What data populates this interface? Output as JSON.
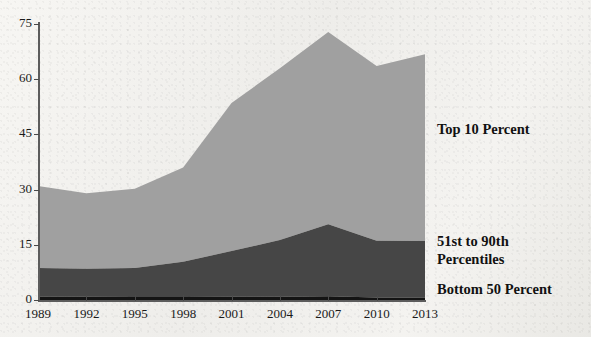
{
  "chart_data": {
    "type": "area",
    "stacked": true,
    "title": "",
    "subtitle": "",
    "xlabel": "",
    "ylabel": "",
    "grid": false,
    "legend_position": "right-inline",
    "x": [
      1989,
      1992,
      1995,
      1998,
      2001,
      2004,
      2007,
      2010,
      2013
    ],
    "categories": [
      "1989",
      "1992",
      "1995",
      "1998",
      "2001",
      "2004",
      "2007",
      "2010",
      "2013"
    ],
    "xtick_labels": [
      "1989",
      "1992",
      "1995",
      "1998",
      "2001",
      "2004",
      "2007",
      "2010",
      "2013"
    ],
    "ytick_labels": [
      "0",
      "15",
      "30",
      "45",
      "60",
      "75"
    ],
    "ytick_values": [
      0,
      15,
      30,
      45,
      60,
      75
    ],
    "ylim": [
      0,
      75
    ],
    "xlim": [
      1989,
      2013
    ],
    "series": [
      {
        "name": "Bottom 50 Percent",
        "color": "#141414",
        "values": [
          0.9,
          0.9,
          0.8,
          0.8,
          0.9,
          0.9,
          1.0,
          0.7,
          0.6
        ]
      },
      {
        "name": "51st to 90th Percentiles",
        "color": "#464646",
        "values": [
          7.8,
          7.6,
          7.9,
          9.6,
          12.4,
          15.4,
          19.6,
          15.4,
          15.4
        ]
      },
      {
        "name": "Top 10 Percent",
        "color": "#a0a0a0",
        "values": [
          22.3,
          20.5,
          21.5,
          25.6,
          40.2,
          46.7,
          52.2,
          47.5,
          50.8
        ]
      }
    ],
    "cumulative_totals": [
      31.0,
      29.0,
      30.2,
      36.0,
      53.5,
      63.0,
      72.8,
      63.6,
      66.8
    ],
    "cumulative_lower_two": [
      8.7,
      8.5,
      8.7,
      10.4,
      13.3,
      16.3,
      20.6,
      16.1,
      16.0
    ],
    "axis_color": "#5c5c5c"
  },
  "legend": {
    "items": [
      {
        "key": "top10",
        "label": "Top 10 Percent"
      },
      {
        "key": "mid40",
        "label": "51st to 90th\nPercentiles"
      },
      {
        "key": "bot50",
        "label": "Bottom 50 Percent"
      }
    ]
  }
}
